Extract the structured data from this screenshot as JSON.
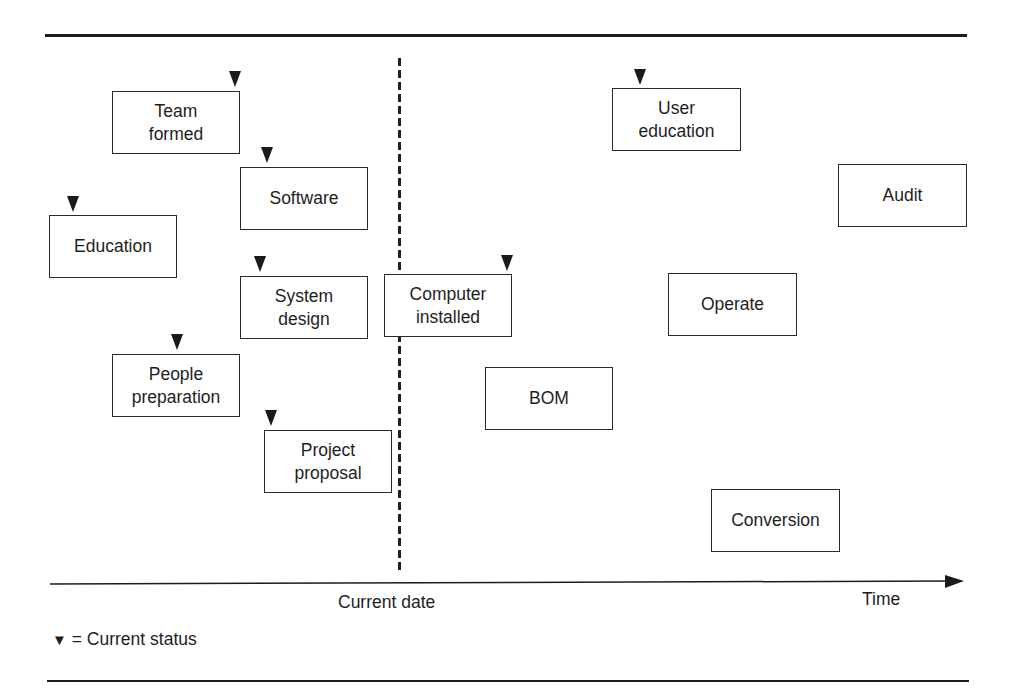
{
  "diagram": {
    "type": "project-status-timeline",
    "current_date_label": "Current date",
    "time_axis_label": "Time",
    "legend": {
      "symbol": "▼",
      "text": "= Current status"
    },
    "tasks": [
      {
        "id": "team-formed",
        "label": "Team\nformed",
        "x": 112,
        "y": 91,
        "w": 128,
        "h": 63,
        "status_marker": true,
        "marker_x": 235,
        "marker_y": 71
      },
      {
        "id": "software",
        "label": "Software",
        "x": 240,
        "y": 167,
        "w": 128,
        "h": 63,
        "status_marker": true,
        "marker_x": 267,
        "marker_y": 147
      },
      {
        "id": "education",
        "label": "Education",
        "x": 49,
        "y": 215,
        "w": 128,
        "h": 63,
        "status_marker": true,
        "marker_x": 73,
        "marker_y": 196
      },
      {
        "id": "system-design",
        "label": "System\ndesign",
        "x": 240,
        "y": 276,
        "w": 128,
        "h": 63,
        "status_marker": true,
        "marker_x": 260,
        "marker_y": 256
      },
      {
        "id": "people-preparation",
        "label": "People\npreparation",
        "x": 112,
        "y": 354,
        "w": 128,
        "h": 63,
        "status_marker": true,
        "marker_x": 177,
        "marker_y": 334
      },
      {
        "id": "project-proposal",
        "label": "Project\nproposal",
        "x": 264,
        "y": 430,
        "w": 128,
        "h": 63,
        "status_marker": true,
        "marker_x": 271,
        "marker_y": 410
      },
      {
        "id": "computer-installed",
        "label": "Computer\ninstalled",
        "x": 384,
        "y": 274,
        "w": 128,
        "h": 63,
        "status_marker": true,
        "marker_x": 507,
        "marker_y": 255
      },
      {
        "id": "bom",
        "label": "BOM",
        "x": 485,
        "y": 367,
        "w": 128,
        "h": 63,
        "status_marker": false
      },
      {
        "id": "user-education",
        "label": "User\neducation",
        "x": 612,
        "y": 88,
        "w": 129,
        "h": 63,
        "status_marker": true,
        "marker_x": 640,
        "marker_y": 69
      },
      {
        "id": "audit",
        "label": "Audit",
        "x": 838,
        "y": 164,
        "w": 129,
        "h": 63,
        "status_marker": false
      },
      {
        "id": "operate",
        "label": "Operate",
        "x": 668,
        "y": 273,
        "w": 129,
        "h": 63,
        "status_marker": false
      },
      {
        "id": "conversion",
        "label": "Conversion",
        "x": 711,
        "y": 489,
        "w": 129,
        "h": 63,
        "status_marker": false
      }
    ],
    "colors": {
      "ink": "#1c1c1c",
      "background": "#ffffff"
    }
  }
}
